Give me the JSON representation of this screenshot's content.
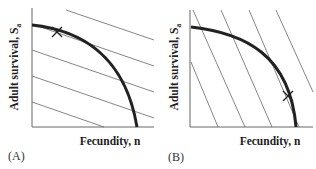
{
  "figure": {
    "panels": [
      {
        "id": "A",
        "panel_label": "(A)",
        "ylabel": "Adult survival, S",
        "ylabel_sub": "a",
        "xlabel": "Fecundity, n",
        "description": "Trade-off curve with shallow fitness isoclines; optimum (X) near high survival / low fecundity"
      },
      {
        "id": "B",
        "panel_label": "(B)",
        "ylabel": "Adult survival, S",
        "ylabel_sub": "a",
        "xlabel": "Fecundity, n",
        "description": "Trade-off curve with steep fitness isoclines; optimum (X) near high fecundity / low survival"
      }
    ],
    "colors": {
      "curve": "#222222",
      "isoline": "#555555",
      "axis": "#555555",
      "text": "#222222"
    }
  }
}
